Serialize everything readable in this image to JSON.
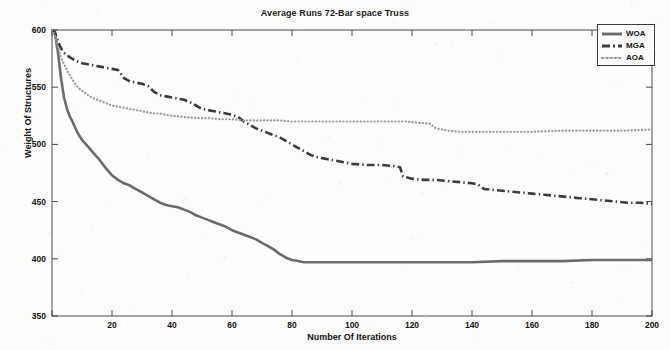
{
  "chart_data": {
    "type": "line",
    "title": "Average Runs 72-Bar space Truss",
    "xlabel": "Number Of Iterations",
    "ylabel": "Weight Of Structures",
    "xlim": [
      0,
      200
    ],
    "ylim": [
      350,
      600
    ],
    "xticks": [
      0,
      20,
      40,
      60,
      80,
      100,
      120,
      140,
      160,
      180,
      200
    ],
    "xticklabels": [
      "",
      "20",
      "40",
      "60",
      "80",
      "100",
      "120",
      "140",
      "160",
      "180",
      "200"
    ],
    "yticks": [
      350,
      400,
      450,
      500,
      550,
      600
    ],
    "yticklabels": [
      "350",
      "400",
      "450",
      "500",
      "550",
      "600"
    ],
    "grid": false,
    "legend_position": "top-right",
    "series": [
      {
        "name": "WOA",
        "style": "solid",
        "color": "#6b6b6b",
        "width": 2.6,
        "points": [
          [
            0,
            600
          ],
          [
            1,
            597
          ],
          [
            2,
            580
          ],
          [
            3,
            558
          ],
          [
            4,
            541
          ],
          [
            5,
            531
          ],
          [
            6,
            524
          ],
          [
            7,
            519
          ],
          [
            8,
            513
          ],
          [
            9,
            508
          ],
          [
            10,
            504
          ],
          [
            12,
            498
          ],
          [
            14,
            492
          ],
          [
            16,
            486
          ],
          [
            18,
            479
          ],
          [
            20,
            473
          ],
          [
            22,
            469
          ],
          [
            24,
            466
          ],
          [
            26,
            464
          ],
          [
            28,
            461
          ],
          [
            30,
            458
          ],
          [
            32,
            455
          ],
          [
            34,
            452
          ],
          [
            36,
            449
          ],
          [
            38,
            447
          ],
          [
            40,
            446
          ],
          [
            42,
            445
          ],
          [
            44,
            443
          ],
          [
            46,
            441
          ],
          [
            48,
            438
          ],
          [
            50,
            436
          ],
          [
            52,
            434
          ],
          [
            54,
            432
          ],
          [
            56,
            430
          ],
          [
            58,
            428
          ],
          [
            60,
            425
          ],
          [
            62,
            423
          ],
          [
            64,
            421
          ],
          [
            66,
            419
          ],
          [
            68,
            417
          ],
          [
            70,
            414
          ],
          [
            72,
            411
          ],
          [
            74,
            408
          ],
          [
            76,
            404
          ],
          [
            78,
            401
          ],
          [
            80,
            399
          ],
          [
            82,
            398
          ],
          [
            84,
            397
          ],
          [
            86,
            397
          ],
          [
            90,
            397
          ],
          [
            95,
            397
          ],
          [
            100,
            397
          ],
          [
            110,
            397
          ],
          [
            120,
            397
          ],
          [
            130,
            397
          ],
          [
            140,
            397
          ],
          [
            150,
            398
          ],
          [
            160,
            398
          ],
          [
            170,
            398
          ],
          [
            180,
            399
          ],
          [
            190,
            399
          ],
          [
            200,
            399
          ]
        ]
      },
      {
        "name": "MGA",
        "style": "dashdot",
        "color": "#3c3c3c",
        "width": 2.6,
        "points": [
          [
            0,
            600
          ],
          [
            1,
            598
          ],
          [
            2,
            590
          ],
          [
            3,
            584
          ],
          [
            4,
            580
          ],
          [
            6,
            576
          ],
          [
            8,
            573
          ],
          [
            10,
            571
          ],
          [
            12,
            570
          ],
          [
            14,
            569
          ],
          [
            16,
            568
          ],
          [
            18,
            567
          ],
          [
            20,
            566
          ],
          [
            22,
            565
          ],
          [
            24,
            558
          ],
          [
            26,
            555
          ],
          [
            28,
            554
          ],
          [
            30,
            553
          ],
          [
            32,
            551
          ],
          [
            34,
            546
          ],
          [
            36,
            543
          ],
          [
            38,
            542
          ],
          [
            40,
            541
          ],
          [
            42,
            540
          ],
          [
            44,
            539
          ],
          [
            46,
            537
          ],
          [
            48,
            534
          ],
          [
            50,
            531
          ],
          [
            52,
            530
          ],
          [
            54,
            529
          ],
          [
            56,
            528
          ],
          [
            58,
            527
          ],
          [
            60,
            526
          ],
          [
            62,
            524
          ],
          [
            64,
            520
          ],
          [
            66,
            517
          ],
          [
            68,
            514
          ],
          [
            70,
            512
          ],
          [
            72,
            510
          ],
          [
            74,
            508
          ],
          [
            76,
            506
          ],
          [
            78,
            503
          ],
          [
            80,
            500
          ],
          [
            82,
            497
          ],
          [
            84,
            494
          ],
          [
            86,
            491
          ],
          [
            88,
            489
          ],
          [
            90,
            488
          ],
          [
            92,
            487
          ],
          [
            94,
            486
          ],
          [
            96,
            485
          ],
          [
            98,
            484
          ],
          [
            100,
            483
          ],
          [
            105,
            482
          ],
          [
            110,
            482
          ],
          [
            114,
            481
          ],
          [
            116,
            480
          ],
          [
            117,
            472
          ],
          [
            120,
            470
          ],
          [
            124,
            469
          ],
          [
            128,
            469
          ],
          [
            132,
            468
          ],
          [
            136,
            467
          ],
          [
            140,
            466
          ],
          [
            142,
            465
          ],
          [
            144,
            461
          ],
          [
            148,
            460
          ],
          [
            152,
            459
          ],
          [
            156,
            458
          ],
          [
            160,
            457
          ],
          [
            164,
            456
          ],
          [
            168,
            455
          ],
          [
            172,
            454
          ],
          [
            176,
            453
          ],
          [
            180,
            452
          ],
          [
            184,
            451
          ],
          [
            188,
            450
          ],
          [
            192,
            449
          ],
          [
            196,
            449
          ],
          [
            200,
            448
          ]
        ]
      },
      {
        "name": "AOA",
        "style": "dotted",
        "color": "#9a9a9a",
        "width": 2.2,
        "points": [
          [
            0,
            600
          ],
          [
            1,
            595
          ],
          [
            2,
            585
          ],
          [
            3,
            576
          ],
          [
            4,
            570
          ],
          [
            5,
            565
          ],
          [
            6,
            560
          ],
          [
            7,
            556
          ],
          [
            8,
            552
          ],
          [
            9,
            549
          ],
          [
            10,
            547
          ],
          [
            12,
            543
          ],
          [
            14,
            540
          ],
          [
            16,
            538
          ],
          [
            18,
            536
          ],
          [
            20,
            534
          ],
          [
            22,
            533
          ],
          [
            24,
            532
          ],
          [
            26,
            531
          ],
          [
            28,
            530
          ],
          [
            30,
            529
          ],
          [
            32,
            528
          ],
          [
            34,
            527
          ],
          [
            36,
            527
          ],
          [
            38,
            526
          ],
          [
            40,
            525
          ],
          [
            44,
            524
          ],
          [
            48,
            523
          ],
          [
            52,
            523
          ],
          [
            56,
            522
          ],
          [
            60,
            522
          ],
          [
            64,
            521
          ],
          [
            68,
            521
          ],
          [
            72,
            521
          ],
          [
            76,
            521
          ],
          [
            80,
            520
          ],
          [
            90,
            520
          ],
          [
            100,
            520
          ],
          [
            110,
            520
          ],
          [
            118,
            520
          ],
          [
            122,
            519
          ],
          [
            126,
            518
          ],
          [
            128,
            514
          ],
          [
            132,
            512
          ],
          [
            136,
            511
          ],
          [
            140,
            511
          ],
          [
            150,
            511
          ],
          [
            160,
            511
          ],
          [
            170,
            512
          ],
          [
            180,
            512
          ],
          [
            190,
            512
          ],
          [
            200,
            513
          ]
        ]
      }
    ]
  },
  "legend": {
    "items": [
      {
        "label": "WOA"
      },
      {
        "label": "MGA"
      },
      {
        "label": "AOA"
      }
    ]
  }
}
